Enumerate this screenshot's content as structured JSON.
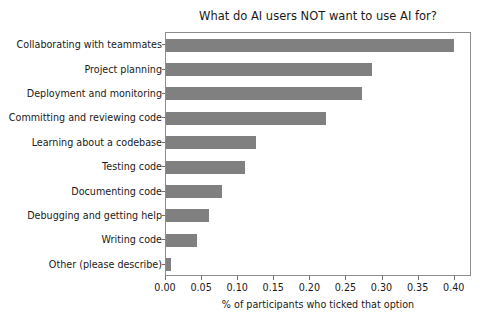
{
  "chart_data": {
    "type": "bar",
    "orientation": "horizontal",
    "title": "What do AI users NOT want to use AI for?",
    "xlabel": "% of participants who ticked that option",
    "ylabel": "",
    "xlim": [
      0.0,
      0.4239
    ],
    "grid": false,
    "legend": null,
    "bar_color": "#808080",
    "categories": [
      "Collaborating with teammates",
      "Project planning",
      "Deployment and monitoring",
      "Committing and reviewing code",
      "Learning about a codebase",
      "Testing code",
      "Documenting code",
      "Debugging and getting help",
      "Writing code",
      "Other (please describe)"
    ],
    "values": [
      0.399,
      0.286,
      0.272,
      0.221,
      0.124,
      0.11,
      0.077,
      0.06,
      0.043,
      0.007
    ],
    "xticks": [
      0.0,
      0.05,
      0.1,
      0.15,
      0.2,
      0.25,
      0.3,
      0.35,
      0.4
    ],
    "xticklabels": [
      "0.00",
      "0.05",
      "0.10",
      "0.15",
      "0.20",
      "0.25",
      "0.30",
      "0.35",
      "0.40"
    ]
  }
}
